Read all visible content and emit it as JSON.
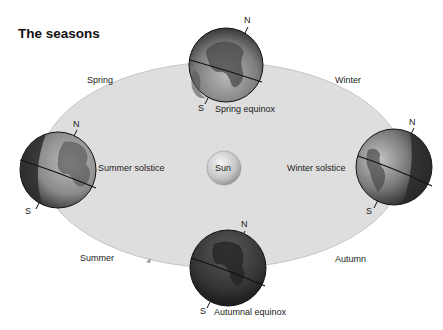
{
  "title": "The seasons",
  "center": {
    "label": "Sun"
  },
  "seasons": [
    {
      "name": "Spring",
      "label": "Spring"
    },
    {
      "name": "Winter",
      "label": "Winter"
    },
    {
      "name": "Summer",
      "label": "Summer"
    },
    {
      "name": "Autumn",
      "label": "Autumn"
    }
  ],
  "positions": {
    "top": {
      "label": "Spring equinox",
      "north": "N",
      "south": "S"
    },
    "left": {
      "label": "Summer solstice",
      "north": "N",
      "south": "S"
    },
    "right": {
      "label": "Winter solstice",
      "north": "N",
      "south": "S"
    },
    "bottom": {
      "label": "Autumnal equinox",
      "north": "N",
      "south": "S"
    }
  },
  "colors": {
    "orbit_fill": "#dedede",
    "globe_dark": "#2e2e2e",
    "globe_light": "#a8a8a8",
    "sun": "#c9c9c9"
  }
}
